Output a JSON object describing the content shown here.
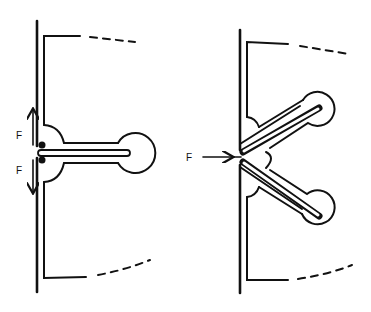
{
  "diagram": {
    "panels": [
      {
        "id": "left",
        "description": "Straight stem structure with opposing vertical forces",
        "labels": [
          {
            "text": "F",
            "role": "upward-force"
          },
          {
            "text": "F",
            "role": "downward-force"
          }
        ]
      },
      {
        "id": "right",
        "description": "V-shaped branching stems with a horizontal applied force",
        "labels": [
          {
            "text": "F",
            "role": "horizontal-force"
          }
        ]
      }
    ],
    "colors": {
      "ink": "#111111",
      "background": "#ffffff"
    }
  }
}
